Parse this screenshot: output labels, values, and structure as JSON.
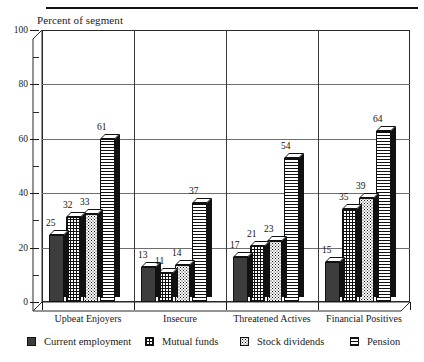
{
  "figure": {
    "axis_title": "Percent of segment",
    "top_rule": true
  },
  "chart_data": {
    "type": "bar",
    "title": "",
    "subtitle": "",
    "xlabel": "",
    "ylabel": "Percent of segment",
    "ylim": [
      0,
      100
    ],
    "yticks": [
      0,
      20,
      40,
      60,
      80,
      100
    ],
    "ytick_labels": [
      "0",
      "20",
      "40",
      "60",
      "80",
      "100"
    ],
    "yminor_step": 10,
    "grid": "horizontal-and-vertical",
    "legend_position": "bottom",
    "style": "3d-columns",
    "categories": [
      "Upbeat Enjoyers",
      "Insecure",
      "Threatened Actives",
      "Financial Positives"
    ],
    "series": [
      {
        "name": "Current employment",
        "pattern": "solid-dark",
        "values": [
          25,
          13,
          17,
          15
        ]
      },
      {
        "name": "Mutual funds",
        "pattern": "grid",
        "values": [
          32,
          11,
          21,
          35
        ]
      },
      {
        "name": "Stock dividends",
        "pattern": "dots",
        "values": [
          33,
          14,
          23,
          39
        ]
      },
      {
        "name": "Pension",
        "pattern": "h-lines",
        "values": [
          61,
          37,
          54,
          64
        ]
      }
    ]
  },
  "legend": {
    "items": [
      {
        "label": "Current employment",
        "pattern": "solid-dark"
      },
      {
        "label": "Mutual funds",
        "pattern": "grid"
      },
      {
        "label": "Stock dividends",
        "pattern": "dots"
      },
      {
        "label": "Pension",
        "pattern": "h-lines"
      }
    ]
  }
}
